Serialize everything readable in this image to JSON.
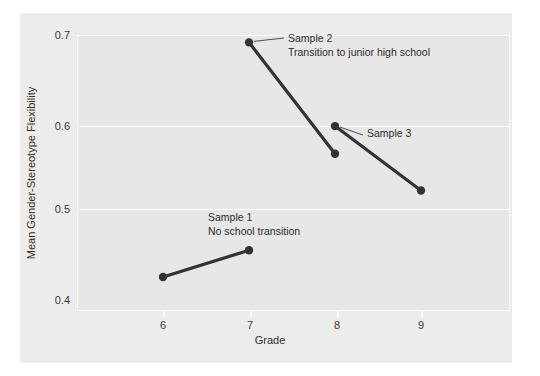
{
  "chart_data": {
    "type": "line",
    "title": "",
    "xlabel": "Grade",
    "ylabel": "Mean Gender-Stereotype Flexibility",
    "xlim": [
      5.5,
      9.6
    ],
    "ylim": [
      0.4,
      0.7
    ],
    "xticks": [
      "6",
      "7",
      "8",
      "9"
    ],
    "yticks": [
      "0.4",
      "0.5",
      "0.6",
      "0.7"
    ],
    "grid": "horizontal-only",
    "legend": "none (inline annotations)",
    "marker_color": "#333333",
    "line_color": "#333333",
    "panel_color": "#ececec",
    "plot_color": "#e7e7e7",
    "grid_color": "#fbfbfb",
    "series": [
      {
        "name": "Sample 1",
        "annotation": "No school transition",
        "x": [
          6,
          7
        ],
        "values": [
          0.437,
          0.466
        ]
      },
      {
        "name": "Sample 2",
        "annotation": "Transition to junior high school",
        "x": [
          7,
          8
        ],
        "values": [
          0.692,
          0.571
        ]
      },
      {
        "name": "Sample 3",
        "annotation": "",
        "x": [
          8,
          9
        ],
        "values": [
          0.601,
          0.531
        ]
      }
    ]
  },
  "axes": {
    "x_title": "Grade",
    "y_title": "Mean Gender-Stereotype Flexibility",
    "x_tick_labels": [
      "6",
      "7",
      "8",
      "9"
    ],
    "y_tick_labels": [
      "0.7",
      "0.6",
      "0.5",
      "0.4"
    ]
  },
  "annotations": {
    "sample2_line1": "Sample 2",
    "sample2_line2": "Transition to junior high school",
    "sample3_line1": "Sample 3",
    "sample1_line1": "Sample 1",
    "sample1_line2": "No school transition"
  }
}
